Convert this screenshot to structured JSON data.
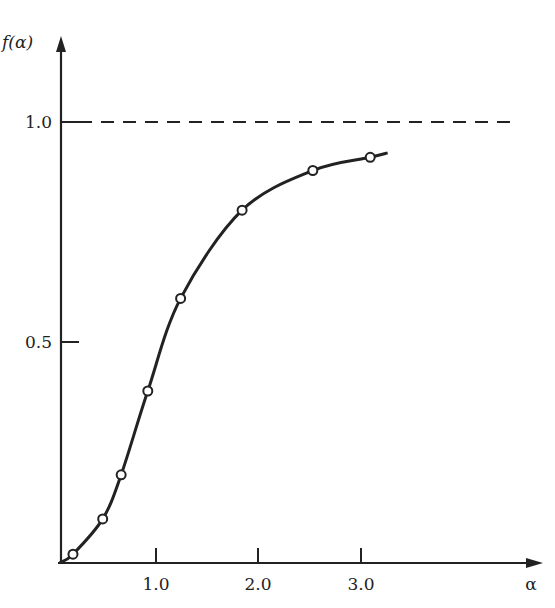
{
  "chart_data": {
    "type": "line",
    "title": "",
    "xlabel": "α",
    "ylabel": "f(α)",
    "x_ticks": [
      {
        "value": 1.0,
        "label": "1.0"
      },
      {
        "value": 2.0,
        "label": "2.0"
      },
      {
        "value": 3.0,
        "label": "3.0"
      }
    ],
    "y_ticks": [
      {
        "value": 0.5,
        "label": "0.5"
      },
      {
        "value": 1.0,
        "label": "1.0"
      }
    ],
    "xlim": [
      0.06,
      4.75
    ],
    "ylim": [
      0,
      1.1
    ],
    "grid": false,
    "reference_lines": [
      {
        "orientation": "horizontal",
        "value": 1.0,
        "style": "dashed"
      }
    ],
    "series": [
      {
        "name": "f(α)",
        "marker": "open-circle",
        "line": "smooth",
        "x": [
          0.19,
          0.48,
          0.66,
          0.92,
          1.24,
          1.84,
          2.53,
          3.09
        ],
        "y": [
          0.02,
          0.1,
          0.2,
          0.39,
          0.6,
          0.8,
          0.89,
          0.92
        ]
      }
    ],
    "curve_end": {
      "x": 3.26,
      "y": 0.93
    }
  },
  "labels": {
    "y_axis": "f(α)",
    "x_axis": "α",
    "y_tick_1": "1.0",
    "y_tick_05": "0.5",
    "x_tick_1": "1.0",
    "x_tick_2": "2.0",
    "x_tick_3": "3.0"
  }
}
